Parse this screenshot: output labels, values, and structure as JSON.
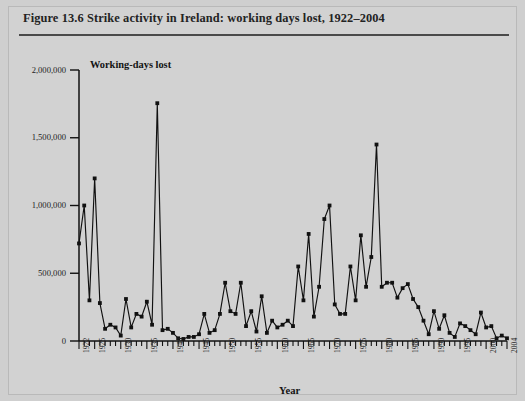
{
  "figure": {
    "title": "Figure 13.6 Strike activity in Ireland: working days lost, 1922–2004",
    "background_color": "#d2d2d2",
    "line_color": "#111111"
  },
  "chart_data": {
    "type": "line",
    "title": "Figure 13.6 Strike activity in Ireland: working days lost, 1922–2004",
    "series_label": "Working-days lost",
    "xlabel": "Year",
    "ylabel": "",
    "xlim": [
      1922,
      2004
    ],
    "ylim": [
      0,
      2000000
    ],
    "grid": false,
    "legend_position": "none",
    "marker": "square",
    "y_tick_labels": [
      "2,000,000",
      "1,500,000",
      "1,000,000",
      "500,000",
      "0"
    ],
    "y_ticks": [
      2000000,
      1500000,
      1000000,
      500000,
      0
    ],
    "x_tick_labels": [
      "1922",
      "1925",
      "1930",
      "1935",
      "1940",
      "1945",
      "1950",
      "1955",
      "1960",
      "1965",
      "1970",
      "1975",
      "1980",
      "1985",
      "1990",
      "1995",
      "2000",
      "2004"
    ],
    "x_ticks": [
      1922,
      1925,
      1930,
      1935,
      1940,
      1945,
      1950,
      1955,
      1960,
      1965,
      1970,
      1975,
      1980,
      1985,
      1990,
      1995,
      2000,
      2004
    ],
    "x_minor_tick_interval": 1,
    "x": [
      1922,
      1923,
      1924,
      1925,
      1926,
      1927,
      1928,
      1929,
      1930,
      1931,
      1932,
      1933,
      1934,
      1935,
      1936,
      1937,
      1938,
      1939,
      1940,
      1941,
      1942,
      1943,
      1944,
      1945,
      1946,
      1947,
      1948,
      1949,
      1950,
      1951,
      1952,
      1953,
      1954,
      1955,
      1956,
      1957,
      1958,
      1959,
      1960,
      1961,
      1962,
      1963,
      1964,
      1965,
      1966,
      1967,
      1968,
      1969,
      1970,
      1971,
      1972,
      1973,
      1974,
      1975,
      1976,
      1977,
      1978,
      1979,
      1980,
      1981,
      1982,
      1983,
      1984,
      1985,
      1986,
      1987,
      1988,
      1989,
      1990,
      1991,
      1992,
      1993,
      1994,
      1995,
      1996,
      1997,
      1998,
      1999,
      2000,
      2001,
      2002,
      2003,
      2004
    ],
    "values": [
      720000,
      1000000,
      300000,
      1200000,
      280000,
      90000,
      120000,
      100000,
      40000,
      310000,
      100000,
      200000,
      180000,
      290000,
      120000,
      1755000,
      80000,
      90000,
      60000,
      20000,
      15000,
      30000,
      30000,
      50000,
      200000,
      60000,
      80000,
      200000,
      430000,
      220000,
      200000,
      430000,
      110000,
      220000,
      70000,
      330000,
      60000,
      150000,
      100000,
      120000,
      150000,
      110000,
      550000,
      300000,
      790000,
      180000,
      400000,
      900000,
      1000000,
      270000,
      200000,
      200000,
      550000,
      300000,
      780000,
      400000,
      620000,
      1450000,
      400000,
      430000,
      430000,
      320000,
      390000,
      420000,
      310000,
      250000,
      150000,
      50000,
      220000,
      90000,
      190000,
      60000,
      30000,
      130000,
      110000,
      80000,
      50000,
      210000,
      100000,
      110000,
      20000,
      40000,
      20000
    ]
  }
}
